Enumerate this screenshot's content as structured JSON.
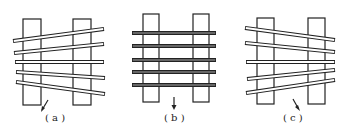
{
  "figure": {
    "panels": [
      {
        "label": "( a )",
        "arrow": "diagonal-up-right",
        "posts": [
          {
            "x": 23,
            "y": 19,
            "w": 18,
            "h": 86
          },
          {
            "x": 73,
            "y": 19,
            "w": 18,
            "h": 86
          }
        ],
        "bars": [
          [
            13,
            41,
            104,
            29
          ],
          [
            14,
            53,
            104,
            44
          ],
          [
            15,
            62,
            104,
            62
          ],
          [
            16,
            72,
            105,
            78
          ],
          [
            16,
            82,
            105,
            94
          ]
        ]
      },
      {
        "label": "( b )",
        "arrow": "down",
        "posts": [
          {
            "x": 143,
            "y": 14,
            "w": 16,
            "h": 88
          },
          {
            "x": 193,
            "y": 14,
            "w": 16,
            "h": 88
          }
        ],
        "bars": [
          [
            132,
            33,
            216,
            33
          ],
          [
            132,
            46,
            216,
            46
          ],
          [
            132,
            60,
            216,
            60
          ],
          [
            132,
            72,
            216,
            72
          ],
          [
            132,
            85,
            216,
            85
          ]
        ]
      },
      {
        "label": "( c )",
        "arrow": "diagonal-down-right",
        "posts": [
          {
            "x": 257,
            "y": 18,
            "w": 17,
            "h": 86
          },
          {
            "x": 308,
            "y": 18,
            "w": 17,
            "h": 86
          }
        ],
        "bars": [
          [
            245,
            28,
            335,
            40
          ],
          [
            245,
            43,
            335,
            52
          ],
          [
            246,
            62,
            335,
            62
          ],
          [
            247,
            79,
            335,
            70
          ],
          [
            246,
            93,
            335,
            80
          ]
        ]
      }
    ]
  }
}
